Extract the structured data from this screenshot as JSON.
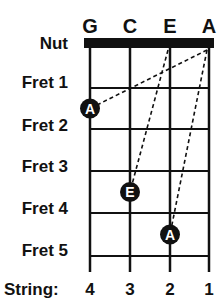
{
  "string_names": [
    "G",
    "C",
    "E",
    "A"
  ],
  "nut_label": "Nut",
  "fret_labels": [
    "Fret 1",
    "Fret 2",
    "Fret 3",
    "Fret 4",
    "Fret 5"
  ],
  "string_label": "String:",
  "string_numbers": [
    "4",
    "3",
    "2",
    "1"
  ],
  "dots": [
    {
      "note": "A",
      "string_index": 0,
      "fret": 2
    },
    {
      "note": "E",
      "string_index": 1,
      "fret": 4
    },
    {
      "note": "A",
      "string_index": 2,
      "fret": 5
    }
  ],
  "dashed_links": [
    {
      "from": {
        "string_index": 3,
        "fret": 0
      },
      "to_dot": 0
    },
    {
      "from": {
        "string_index": 2,
        "fret": 0
      },
      "to_dot": 1
    },
    {
      "from": {
        "string_index": 3,
        "fret": 0
      },
      "to_dot": 2
    }
  ],
  "colors": {
    "ink": "#111111",
    "dot_fill": "#111111",
    "dot_text": "#ffffff"
  }
}
